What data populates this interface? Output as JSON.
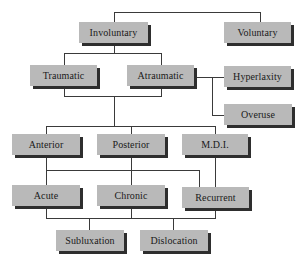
{
  "diagram": {
    "type": "hierarchy",
    "nodes": {
      "involuntary": "Involuntary",
      "voluntary": "Voluntary",
      "traumatic": "Traumatic",
      "atraumatic": "Atraumatic",
      "hyperlaxity": "Hyperlaxity",
      "overuse": "Overuse",
      "anterior": "Anterior",
      "posterior": "Posterior",
      "mdi": "M.D.I.",
      "acute": "Acute",
      "chronic": "Chronic",
      "recurrent": "Recurrent",
      "subluxation": "Subluxation",
      "dislocation": "Dislocation"
    },
    "edges": [
      [
        "involuntary",
        "voluntary"
      ],
      [
        "involuntary",
        "traumatic"
      ],
      [
        "involuntary",
        "atraumatic"
      ],
      [
        "atraumatic",
        "hyperlaxity"
      ],
      [
        "atraumatic",
        "overuse"
      ],
      [
        "traumatic",
        "anterior"
      ],
      [
        "traumatic",
        "posterior"
      ],
      [
        "traumatic",
        "mdi"
      ],
      [
        "atraumatic",
        "anterior"
      ],
      [
        "atraumatic",
        "posterior"
      ],
      [
        "atraumatic",
        "mdi"
      ],
      [
        "anterior",
        "acute"
      ],
      [
        "posterior",
        "chronic"
      ],
      [
        "mdi",
        "recurrent"
      ],
      [
        "acute",
        "subluxation"
      ],
      [
        "chronic",
        "subluxation"
      ],
      [
        "recurrent",
        "dislocation"
      ]
    ],
    "colors": {
      "box_fill": "#b9b9b9",
      "box_shadow": "#2e2e2e",
      "line": "#3a3a3a",
      "text": "#1a1a1a",
      "background": "#ffffff"
    }
  }
}
